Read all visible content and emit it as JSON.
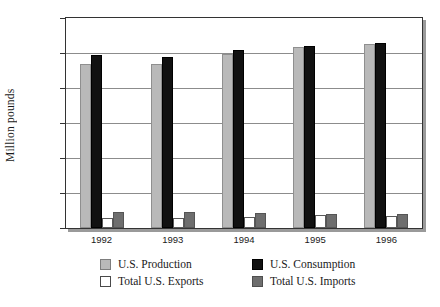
{
  "chart_data": {
    "type": "bar",
    "title": "",
    "subtitle": "",
    "xlabel": "",
    "ylabel": "Million pounds",
    "categories": [
      "1992",
      "1993",
      "1994",
      "1995",
      "1996"
    ],
    "ylim": [
      0,
      30000
    ],
    "ytick_values": [
      0,
      5000,
      10000,
      15000,
      20000,
      25000,
      30000
    ],
    "ytick_labels": [
      "0",
      "5,000",
      "10,000",
      "15,000",
      "20,000",
      "25,000",
      "30,000"
    ],
    "grid": true,
    "legend_position": "bottom",
    "series": [
      {
        "name": "U.S. Production",
        "key": "production",
        "color": "#b9b9b9",
        "values": [
          23400,
          23450,
          24900,
          25800,
          26300
        ]
      },
      {
        "name": "U.S. Consumption",
        "key": "consumption",
        "color": "#111111",
        "values": [
          24650,
          24400,
          25500,
          26000,
          26500
        ]
      },
      {
        "name": "Total U.S. Exports",
        "key": "exports",
        "color": "#ffffff",
        "values": [
          1450,
          1450,
          1600,
          1800,
          1750
        ]
      },
      {
        "name": "Total U.S. Imports",
        "key": "imports",
        "color": "#6e6e6e",
        "values": [
          2250,
          2250,
          2200,
          1950,
          1950
        ]
      }
    ]
  },
  "legend": {
    "items": [
      {
        "label": "U.S. Production",
        "key": "production"
      },
      {
        "label": "U.S. Consumption",
        "key": "consumption"
      },
      {
        "label": "Total U.S. Exports",
        "key": "exports"
      },
      {
        "label": "Total U.S. Imports",
        "key": "imports"
      }
    ]
  }
}
